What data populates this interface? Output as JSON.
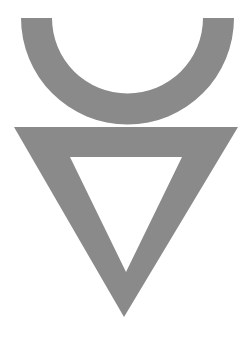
{
  "canvas": {
    "width": 250,
    "height": 339,
    "background_color": "#ffffff",
    "title": "Alchemical Symbol Glyph"
  },
  "glyph": {
    "name": "inverted-triangle-with-arc",
    "description": "Grey line-art symbol composed of an upward-opening semicircular arc above a hollow downward-pointing triangle",
    "fill_color": "#8a8a8a",
    "stroke_color": "#8a8a8a",
    "parts": [
      {
        "name": "arc",
        "shape": "semicircular-arc",
        "opening": "up",
        "center_x": 127.5,
        "center_y": 18,
        "outer_radius": 106.5,
        "inner_radius": 75.5,
        "stroke_width": 31,
        "left_outer_x": 21,
        "right_outer_x": 234,
        "top_y": 18,
        "bottom_y": 124.5
      },
      {
        "name": "triangle",
        "shape": "hollow-triangle",
        "orientation": "point-down",
        "outer_vertices": [
          [
            14,
            127
          ],
          [
            238,
            127
          ],
          [
            124,
            317
          ]
        ],
        "inner_vertices": [
          [
            70,
            157
          ],
          [
            182,
            157
          ],
          [
            126,
            272
          ]
        ],
        "outer_top_width": 224,
        "outer_height": 190,
        "inner_top_width": 112,
        "inner_height": 115
      }
    ]
  }
}
